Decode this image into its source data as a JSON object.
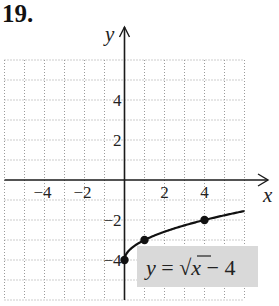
{
  "problem": {
    "number": "19."
  },
  "chart_data": {
    "type": "line",
    "title": "",
    "xlabel": "x",
    "ylabel": "y",
    "xlim": [
      -6,
      6
    ],
    "ylim": [
      -6,
      6
    ],
    "grid": true,
    "grid_style": "dotted",
    "x_ticks": [
      {
        "value": -4,
        "label": "−4"
      },
      {
        "value": -2,
        "label": "−2"
      },
      {
        "value": 2,
        "label": "2"
      },
      {
        "value": 4,
        "label": "4"
      }
    ],
    "y_ticks": [
      {
        "value": 4,
        "label": "4"
      },
      {
        "value": 2,
        "label": "2"
      },
      {
        "value": -2,
        "label": "−2"
      },
      {
        "value": -4,
        "label": "−4"
      }
    ],
    "series": [
      {
        "name": "y = √x − 4",
        "function": "sqrt(x) - 4",
        "domain": [
          0,
          6
        ],
        "highlighted_points": [
          {
            "x": 0,
            "y": -4
          },
          {
            "x": 1,
            "y": -3
          },
          {
            "x": 4,
            "y": -2
          }
        ]
      }
    ],
    "annotation": {
      "text_parts": [
        "y",
        " = ",
        "√",
        "x",
        " − 4"
      ],
      "background": "#d9d9d9"
    }
  },
  "colors": {
    "axis": "#1a1a1a",
    "grid": "#9a9a9a",
    "curve": "#111111",
    "label_box": "#d9d9d9"
  }
}
